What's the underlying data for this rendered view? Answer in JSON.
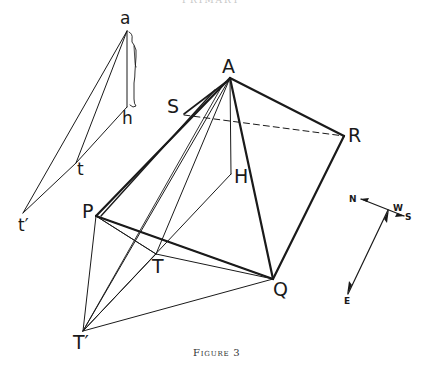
{
  "header": {
    "text": "PRIMARY"
  },
  "caption": {
    "text": "Figure 3"
  },
  "labels": {
    "a": "a",
    "h": "h",
    "t": "t",
    "t_prime": "t′",
    "A": "A",
    "S": "S",
    "R": "R",
    "H": "H",
    "P": "P",
    "T": "T",
    "Q": "Q",
    "T_prime": "T′"
  },
  "compass": {
    "north": "N",
    "south": "S",
    "east": "E",
    "west": "W"
  },
  "colors": {
    "ink": "#1a1a1a",
    "background": "#ffffff",
    "caption": "#333333"
  }
}
